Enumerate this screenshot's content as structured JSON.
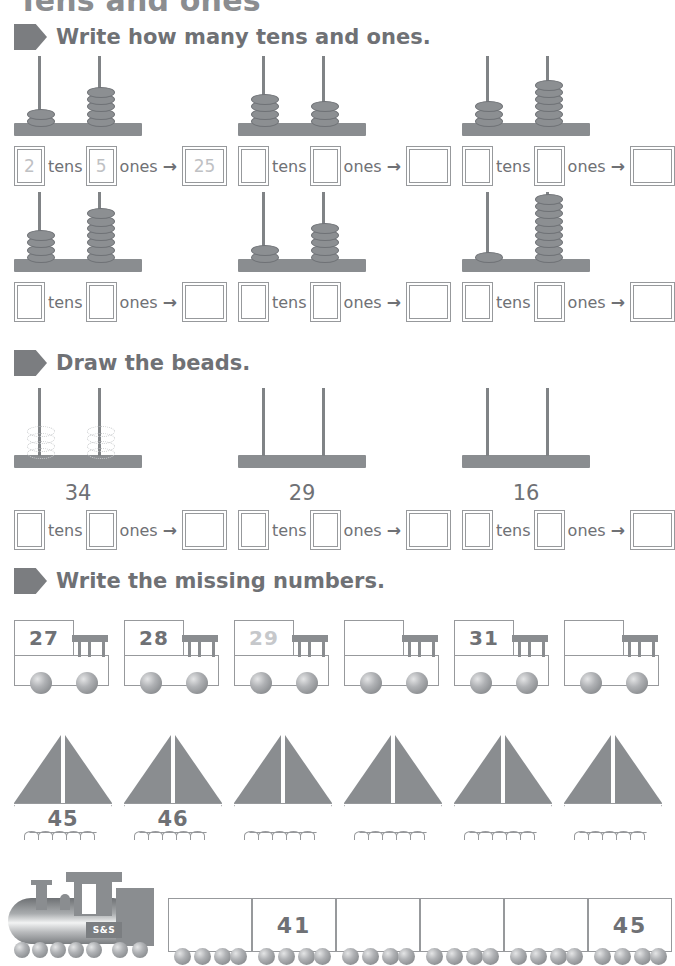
{
  "worksheet": {
    "title": "Tens and ones"
  },
  "sections": [
    {
      "id": "write-tens-ones",
      "heading": "Write how many tens and ones."
    },
    {
      "id": "draw-beads",
      "heading": "Draw the beads."
    },
    {
      "id": "missing-numbers",
      "heading": "Write the missing numbers."
    }
  ],
  "labels": {
    "tens": "tens",
    "ones": "ones",
    "arrow": "→"
  },
  "abacus_exercises": [
    {
      "index": 1,
      "tens_beads": 2,
      "ones_beads": 5,
      "tens_answer": "2",
      "ones_answer": "5",
      "total_answer": "25",
      "prefilled": true
    },
    {
      "index": 2,
      "tens_beads": 4,
      "ones_beads": 3,
      "tens_answer": "",
      "ones_answer": "",
      "total_answer": "",
      "prefilled": false
    },
    {
      "index": 3,
      "tens_beads": 3,
      "ones_beads": 6,
      "tens_answer": "",
      "ones_answer": "",
      "total_answer": "",
      "prefilled": false
    },
    {
      "index": 4,
      "tens_beads": 4,
      "ones_beads": 7,
      "tens_answer": "",
      "ones_answer": "",
      "total_answer": "",
      "prefilled": false
    },
    {
      "index": 5,
      "tens_beads": 2,
      "ones_beads": 5,
      "tens_answer": "",
      "ones_answer": "",
      "total_answer": "",
      "prefilled": false
    },
    {
      "index": 6,
      "tens_beads": 1,
      "ones_beads": 9,
      "tens_answer": "",
      "ones_answer": "",
      "total_answer": "",
      "prefilled": false
    }
  ],
  "draw_beads_exercises": [
    {
      "index": 1,
      "number": "34",
      "guide_beads": true,
      "tens_answer": "",
      "ones_answer": "",
      "total_answer": ""
    },
    {
      "index": 2,
      "number": "29",
      "guide_beads": false,
      "tens_answer": "",
      "ones_answer": "",
      "total_answer": ""
    },
    {
      "index": 3,
      "number": "16",
      "guide_beads": false,
      "tens_answer": "",
      "ones_answer": "",
      "total_answer": ""
    }
  ],
  "trucks": [
    {
      "index": 1,
      "value": "27",
      "faded": false
    },
    {
      "index": 2,
      "value": "28",
      "faded": false
    },
    {
      "index": 3,
      "value": "29",
      "faded": true
    },
    {
      "index": 4,
      "value": "",
      "faded": false
    },
    {
      "index": 5,
      "value": "31",
      "faded": false
    },
    {
      "index": 6,
      "value": "",
      "faded": false
    }
  ],
  "boats": [
    {
      "index": 1,
      "value": "45"
    },
    {
      "index": 2,
      "value": "46"
    },
    {
      "index": 3,
      "value": ""
    },
    {
      "index": 4,
      "value": ""
    },
    {
      "index": 5,
      "value": ""
    },
    {
      "index": 6,
      "value": ""
    }
  ],
  "train": {
    "locomotive_plate": "S&S",
    "cars": [
      {
        "index": 1,
        "value": ""
      },
      {
        "index": 2,
        "value": "41"
      },
      {
        "index": 3,
        "value": ""
      },
      {
        "index": 4,
        "value": ""
      },
      {
        "index": 5,
        "value": ""
      },
      {
        "index": 6,
        "value": "45"
      }
    ]
  },
  "colors": {
    "ink": "#6f7175",
    "figure": "#8a8d90",
    "faded": "#c6c8cb",
    "outline": "#97999c"
  }
}
